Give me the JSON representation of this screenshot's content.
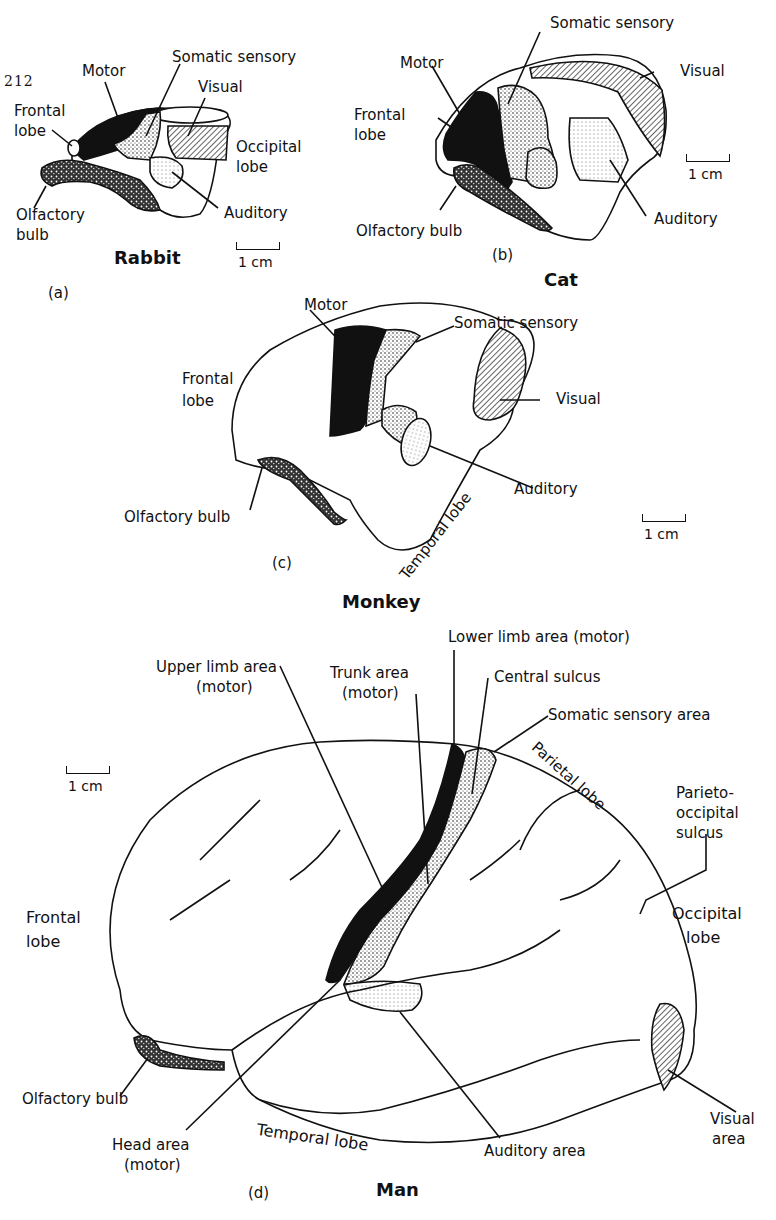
{
  "page_number": "212",
  "panels": {
    "a": {
      "letter": "(a)",
      "species": "Rabbit",
      "scale": "1 cm",
      "labels": {
        "motor": "Motor",
        "somatic": "Somatic sensory",
        "visual": "Visual",
        "frontal1": "Frontal",
        "frontal2": "lobe",
        "occipital1": "Occipital",
        "occipital2": "lobe",
        "olfactory1": "Olfactory",
        "olfactory2": "bulb",
        "auditory": "Auditory"
      }
    },
    "b": {
      "letter": "(b)",
      "species": "Cat",
      "scale": "1 cm",
      "labels": {
        "somatic": "Somatic sensory",
        "motor": "Motor",
        "visual": "Visual",
        "frontal1": "Frontal",
        "frontal2": "lobe",
        "auditory": "Auditory",
        "olfactory": "Olfactory bulb"
      }
    },
    "c": {
      "letter": "(c)",
      "species": "Monkey",
      "scale": "1 cm",
      "labels": {
        "motor": "Motor",
        "somatic": "Somatic sensory",
        "frontal1": "Frontal",
        "frontal2": "lobe",
        "visual": "Visual",
        "auditory": "Auditory",
        "olfactory": "Olfactory bulb",
        "temporal": "Temporal lobe"
      }
    },
    "d": {
      "letter": "(d)",
      "species": "Man",
      "scale": "1 cm",
      "labels": {
        "lower_limb": "Lower limb area (motor)",
        "upper_limb1": "Upper limb area",
        "upper_limb2": "(motor)",
        "trunk1": "Trunk area",
        "trunk2": "(motor)",
        "central_sulcus": "Central sulcus",
        "somatic": "Somatic sensory area",
        "parietal": "Parietal lobe",
        "parieto1": "Parieto-",
        "parieto2": "occipital",
        "parieto3": "sulcus",
        "frontal1": "Frontal",
        "frontal2": "lobe",
        "occipital1": "Occipital",
        "occipital2": "lobe",
        "olfactory": "Olfactory bulb",
        "visual1": "Visual",
        "visual2": "area",
        "head1": "Head area",
        "head2": "(motor)",
        "temporal": "Temporal lobe",
        "auditory": "Auditory area"
      }
    }
  }
}
